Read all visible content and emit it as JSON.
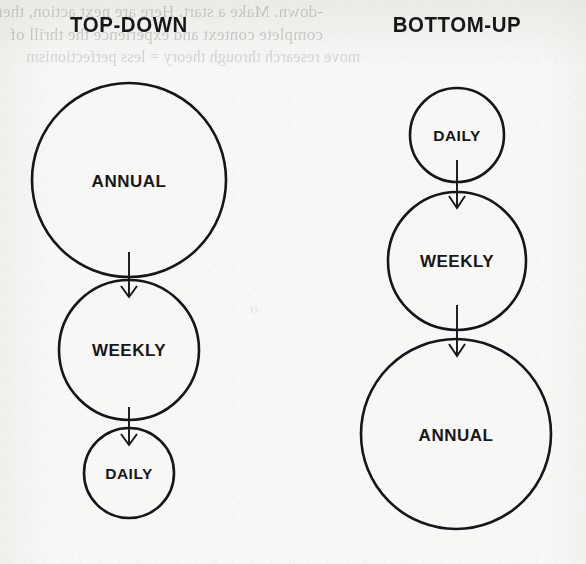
{
  "page": {
    "background_color": "#f7f7f5",
    "ink_color": "#16161a",
    "ghost_text": [
      "-down. Make a start. Here are next action, then",
      "complete context and experience the thrill of",
      "move research through theory = less perfectionism"
    ],
    "ghost_text_faint": "o"
  },
  "columns": [
    {
      "id": "top-down",
      "title": "TOP-DOWN",
      "center_x": 129,
      "nodes": [
        {
          "label": "ANNUAL",
          "cx": 129,
          "cy": 180,
          "r": 97,
          "label_y": 183,
          "size": "large"
        },
        {
          "label": "WEEKLY",
          "cx": 129,
          "cy": 350,
          "r": 70,
          "label_y": 352,
          "size": "medium"
        },
        {
          "label": "DAILY",
          "cx": 129,
          "cy": 473,
          "r": 45,
          "label_y": 475,
          "size": "small"
        }
      ],
      "arrows": [
        {
          "x": 129,
          "y1": 252,
          "y2": 296
        },
        {
          "x": 129,
          "y1": 407,
          "y2": 444
        }
      ]
    },
    {
      "id": "bottom-up",
      "title": "BOTTOM-UP",
      "center_x": 457,
      "nodes": [
        {
          "label": "DAILY",
          "cx": 457,
          "cy": 135,
          "r": 47,
          "label_y": 137,
          "size": "small"
        },
        {
          "label": "WEEKLY",
          "cx": 457,
          "cy": 261,
          "r": 69,
          "label_y": 263,
          "size": "medium"
        },
        {
          "label": "ANNUAL",
          "cx": 456,
          "cy": 434,
          "r": 95,
          "label_y": 437,
          "size": "large"
        }
      ],
      "arrows": [
        {
          "x": 457,
          "y1": 160,
          "y2": 207
        },
        {
          "x": 457,
          "y1": 305,
          "y2": 355
        }
      ]
    }
  ]
}
